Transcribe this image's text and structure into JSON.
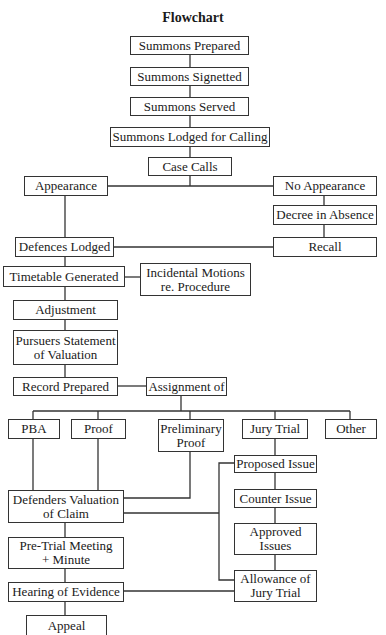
{
  "title": "Flowchart",
  "nodes": {
    "summons_prepared": "Summons Prepared",
    "summons_signetted": "Summons Signetted",
    "summons_served": "Summons Served",
    "summons_lodged": "Summons Lodged for Calling",
    "case_calls": "Case Calls",
    "appearance": "Appearance",
    "no_appearance": "No Appearance",
    "decree_in_absence": "Decree in Absence",
    "defences_lodged": "Defences Lodged",
    "recall": "Recall",
    "timetable_generated": "Timetable Generated",
    "incidental_motions": "Incidental Motions\nre. Procedure",
    "adjustment": "Adjustment",
    "pursuers_statement": "Pursuers Statement\nof Valuation",
    "record_prepared": "Record Prepared",
    "assignment_of": "Assignment of",
    "pba": "PBA",
    "proof": "Proof",
    "preliminary_proof": "Preliminary\nProof",
    "jury_trial": "Jury Trial",
    "other": "Other",
    "proposed_issue": "Proposed Issue",
    "counter_issue": "Counter Issue",
    "approved_issues": "Approved\nIssues",
    "allowance_of_jury_trial": "Allowance of\nJury Trial",
    "defenders_valuation": "Defenders Valuation\nof Claim",
    "pre_trial_meeting": "Pre-Trial Meeting\n+ Minute",
    "hearing_of_evidence": "Hearing of Evidence",
    "appeal": "Appeal"
  },
  "edges": [
    [
      "summons_prepared",
      "summons_signetted"
    ],
    [
      "summons_signetted",
      "summons_served"
    ],
    [
      "summons_served",
      "summons_lodged"
    ],
    [
      "summons_lodged",
      "case_calls"
    ],
    [
      "case_calls",
      "appearance"
    ],
    [
      "case_calls",
      "no_appearance"
    ],
    [
      "no_appearance",
      "decree_in_absence"
    ],
    [
      "decree_in_absence",
      "recall"
    ],
    [
      "appearance",
      "defences_lodged"
    ],
    [
      "recall",
      "defences_lodged"
    ],
    [
      "defences_lodged",
      "timetable_generated"
    ],
    [
      "timetable_generated",
      "incidental_motions"
    ],
    [
      "timetable_generated",
      "adjustment"
    ],
    [
      "adjustment",
      "pursuers_statement"
    ],
    [
      "pursuers_statement",
      "record_prepared"
    ],
    [
      "record_prepared",
      "assignment_of"
    ],
    [
      "assignment_of",
      "pba"
    ],
    [
      "assignment_of",
      "proof"
    ],
    [
      "assignment_of",
      "preliminary_proof"
    ],
    [
      "assignment_of",
      "jury_trial"
    ],
    [
      "assignment_of",
      "other"
    ],
    [
      "pba",
      "defenders_valuation"
    ],
    [
      "proof",
      "defenders_valuation"
    ],
    [
      "preliminary_proof",
      "defenders_valuation"
    ],
    [
      "jury_trial",
      "proposed_issue"
    ],
    [
      "proposed_issue",
      "counter_issue"
    ],
    [
      "counter_issue",
      "approved_issues"
    ],
    [
      "approved_issues",
      "allowance_of_jury_trial"
    ],
    [
      "defenders_valuation",
      "proposed_issue"
    ],
    [
      "defenders_valuation",
      "allowance_of_jury_trial"
    ],
    [
      "defenders_valuation",
      "pre_trial_meeting"
    ],
    [
      "pre_trial_meeting",
      "hearing_of_evidence"
    ],
    [
      "allowance_of_jury_trial",
      "hearing_of_evidence"
    ],
    [
      "hearing_of_evidence",
      "appeal"
    ]
  ]
}
